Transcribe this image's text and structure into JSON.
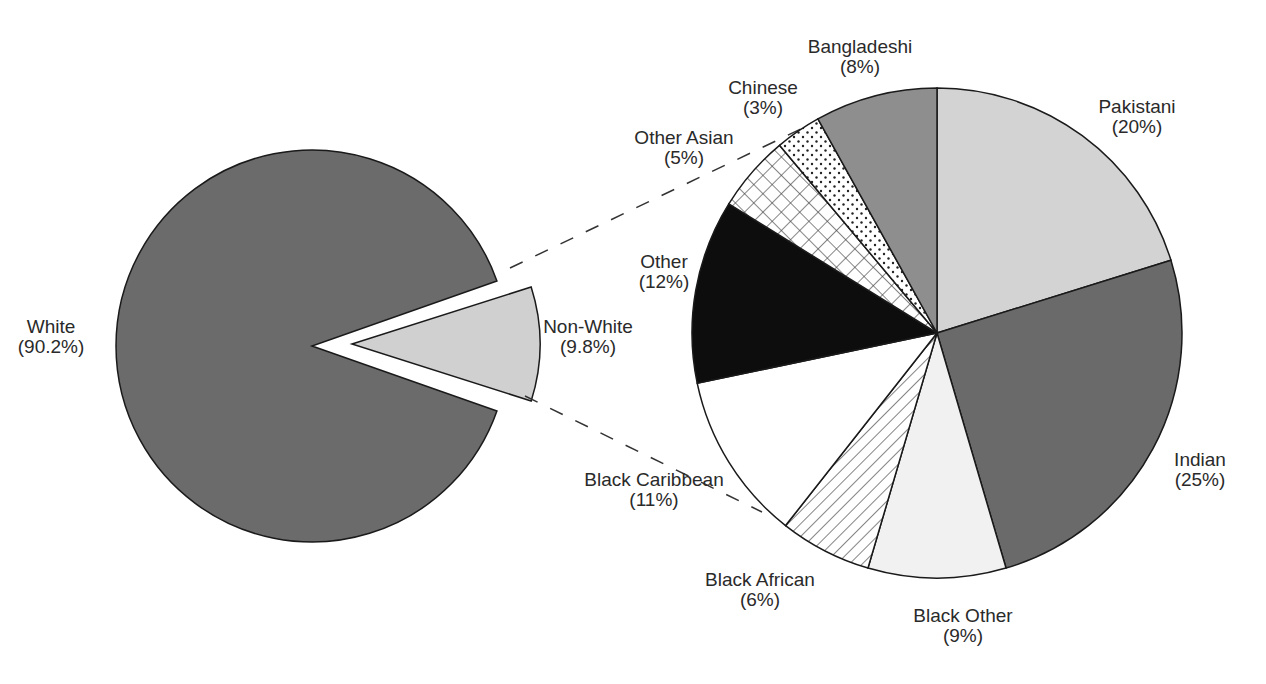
{
  "chart_data": [
    {
      "type": "pie",
      "title": "",
      "slices": [
        {
          "label": "White",
          "value": 90.2,
          "display": "(90.2%)",
          "color": "#6b6b6b"
        },
        {
          "label": "Non-White",
          "value": 9.8,
          "display": "(9.8%)",
          "color": "#d0d0d0",
          "exploded": true
        }
      ]
    },
    {
      "type": "pie",
      "title": "",
      "breakdown_of": "Non-White",
      "slices": [
        {
          "label": "Pakistani",
          "value": 20,
          "display": "(20%)",
          "pattern": "light-gray",
          "color": "#d3d3d3"
        },
        {
          "label": "Indian",
          "value": 25,
          "display": "(25%)",
          "pattern": "dark-gray",
          "color": "#6a6a6a"
        },
        {
          "label": "Black Other",
          "value": 9,
          "display": "(9%)",
          "pattern": "very-light-gray",
          "color": "#f1f1f1"
        },
        {
          "label": "Black African",
          "value": 6,
          "display": "(6%)",
          "pattern": "diagonal-hatch",
          "color": "#ffffff"
        },
        {
          "label": "Black Caribbean",
          "value": 11,
          "display": "(11%)",
          "pattern": "white",
          "color": "#ffffff"
        },
        {
          "label": "Other",
          "value": 12,
          "display": "(12%)",
          "pattern": "black",
          "color": "#0d0d0d"
        },
        {
          "label": "Other Asian",
          "value": 5,
          "display": "(5%)",
          "pattern": "crosshatch",
          "color": "#ffffff"
        },
        {
          "label": "Chinese",
          "value": 3,
          "display": "(3%)",
          "pattern": "dots",
          "color": "#ffffff"
        },
        {
          "label": "Bangladeshi",
          "value": 8,
          "display": "(8%)",
          "pattern": "medium-gray",
          "color": "#8e8e8e"
        }
      ]
    }
  ],
  "labels": {
    "white": {
      "name": "White",
      "pct": "(90.2%)"
    },
    "nonwhite": {
      "name": "Non-White",
      "pct": "(9.8%)"
    },
    "pakistani": {
      "name": "Pakistani",
      "pct": "(20%)"
    },
    "indian": {
      "name": "Indian",
      "pct": "(25%)"
    },
    "black_other": {
      "name": "Black Other",
      "pct": "(9%)"
    },
    "black_african": {
      "name": "Black African",
      "pct": "(6%)"
    },
    "black_caribbean": {
      "name": "Black Caribbean",
      "pct": "(11%)"
    },
    "other": {
      "name": "Other",
      "pct": "(12%)"
    },
    "other_asian": {
      "name": "Other Asian",
      "pct": "(5%)"
    },
    "chinese": {
      "name": "Chinese",
      "pct": "(3%)"
    },
    "bangladeshi": {
      "name": "Bangladeshi",
      "pct": "(8%)"
    }
  }
}
